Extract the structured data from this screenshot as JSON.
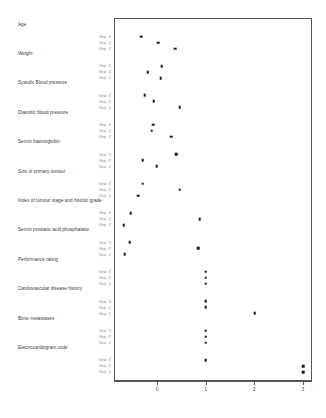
{
  "chart_data": {
    "type": "scatter",
    "title": "",
    "subtitle": "",
    "xlabel": "",
    "ylabel": "",
    "xlim": [
      -0.6,
      3.3
    ],
    "xticks": [
      0,
      1,
      2,
      3
    ],
    "xticklabels": [
      "0",
      "1",
      "2",
      "3"
    ],
    "grid": false,
    "legend": false,
    "group_labels": [
      "Grp. 3",
      "Grp. 2",
      "Grp. 1"
    ],
    "categories": [
      "Age",
      "Weight",
      "Systolic Blood pressure",
      "Diastolic blood pressure",
      "Serum haemoglobin",
      "Size of primary tumour",
      "Index of tumour stage and histolic grade",
      "Serum prostatic acid phosphatase",
      "Performance rating",
      "Cardiovascular disease history",
      "Bone metastases",
      "Electrocardiogram code"
    ],
    "series": [
      {
        "name": "Grp. 3",
        "values": [
          -0.33,
          0.1,
          -0.25,
          -0.08,
          0.39,
          -0.29,
          -0.54,
          -0.56,
          1.0,
          1.0,
          1.0,
          1.0
        ]
      },
      {
        "name": "Grp. 2",
        "values": [
          0.02,
          -0.19,
          -0.07,
          -0.11,
          -0.29,
          0.47,
          0.88,
          0.85,
          1.0,
          1.0,
          1.0,
          3.0
        ]
      },
      {
        "name": "Grp. 1",
        "values": [
          0.37,
          0.08,
          0.47,
          0.29,
          -0.01,
          -0.38,
          -0.68,
          -0.66,
          1.0,
          2.01,
          1.0,
          3.0
        ]
      }
    ]
  },
  "axis": {
    "tick_labels": [
      "0",
      "1",
      "2",
      "3"
    ]
  },
  "variables": {
    "v0": "Age",
    "v1": "Weight",
    "v2": "Systolic Blood pressure",
    "v3": "Diastolic blood pressure",
    "v4": "Serum haemoglobin",
    "v5": "Size of primary tumour",
    "v6": "Index of tumour stage and histolic grade",
    "v7": "Serum prostatic acid phosphatase",
    "v8": "Performance rating",
    "v9": "Cardiovascular disease history",
    "v10": "Bone metastases",
    "v11": "Electrocardiogram code"
  },
  "groups": {
    "g3": "Grp. 3",
    "g2": "Grp. 2",
    "g1": "Grp. 1"
  }
}
